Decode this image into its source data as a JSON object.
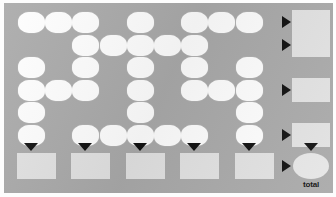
{
  "puzzle": {
    "title": "number crossword sum grid",
    "colors": {
      "board_background": "#aaaaaa",
      "cell_fill": "#fefefe",
      "sum_box_fill": "#e2e2e2",
      "arrow": "#111111",
      "page_background": "#ffffff"
    },
    "grid": {
      "columns": 9,
      "rows": 6,
      "cell_width": 27,
      "cell_height": 21,
      "origin_x": 14,
      "origin_y": 9,
      "col_step": 27.2,
      "row_step": 22.6
    },
    "cells": [
      {
        "row": 1,
        "col": 1,
        "value": ""
      },
      {
        "row": 1,
        "col": 2,
        "value": ""
      },
      {
        "row": 1,
        "col": 3,
        "value": ""
      },
      {
        "row": 1,
        "col": 5,
        "value": ""
      },
      {
        "row": 1,
        "col": 7,
        "value": ""
      },
      {
        "row": 1,
        "col": 8,
        "value": ""
      },
      {
        "row": 1,
        "col": 9,
        "value": ""
      },
      {
        "row": 2,
        "col": 3,
        "value": ""
      },
      {
        "row": 2,
        "col": 4,
        "value": ""
      },
      {
        "row": 2,
        "col": 5,
        "value": ""
      },
      {
        "row": 2,
        "col": 6,
        "value": ""
      },
      {
        "row": 2,
        "col": 7,
        "value": ""
      },
      {
        "row": 3,
        "col": 1,
        "value": ""
      },
      {
        "row": 3,
        "col": 3,
        "value": ""
      },
      {
        "row": 3,
        "col": 5,
        "value": ""
      },
      {
        "row": 3,
        "col": 7,
        "value": ""
      },
      {
        "row": 3,
        "col": 9,
        "value": ""
      },
      {
        "row": 4,
        "col": 1,
        "value": ""
      },
      {
        "row": 4,
        "col": 2,
        "value": ""
      },
      {
        "row": 4,
        "col": 3,
        "value": ""
      },
      {
        "row": 4,
        "col": 5,
        "value": ""
      },
      {
        "row": 4,
        "col": 7,
        "value": ""
      },
      {
        "row": 4,
        "col": 8,
        "value": ""
      },
      {
        "row": 4,
        "col": 9,
        "value": ""
      },
      {
        "row": 5,
        "col": 1,
        "value": ""
      },
      {
        "row": 5,
        "col": 5,
        "value": ""
      },
      {
        "row": 5,
        "col": 9,
        "value": ""
      },
      {
        "row": 6,
        "col": 1,
        "value": ""
      },
      {
        "row": 6,
        "col": 3,
        "value": ""
      },
      {
        "row": 6,
        "col": 4,
        "value": ""
      },
      {
        "row": 6,
        "col": 5,
        "value": ""
      },
      {
        "row": 6,
        "col": 6,
        "value": ""
      },
      {
        "row": 6,
        "col": 7,
        "value": ""
      },
      {
        "row": 6,
        "col": 9,
        "value": ""
      }
    ],
    "row_sums": [
      {
        "row": 1,
        "arrow": "arrow-right",
        "value": ""
      },
      {
        "row": 2,
        "arrow": "arrow-right",
        "value": ""
      },
      {
        "row": 4,
        "arrow": "arrow-right",
        "value": ""
      },
      {
        "row": 6,
        "arrow": "arrow-right",
        "value": ""
      }
    ],
    "column_sums": [
      {
        "col": 1,
        "arrow": "arrow-down",
        "value": ""
      },
      {
        "col": 3,
        "arrow": "arrow-down",
        "value": ""
      },
      {
        "col": 5,
        "arrow": "arrow-down",
        "value": ""
      },
      {
        "col": 7,
        "arrow": "arrow-down",
        "value": ""
      },
      {
        "col": 9,
        "arrow": "arrow-down",
        "value": ""
      }
    ],
    "total": {
      "label": "total",
      "value": "",
      "arrow_from_left": "arrow-right",
      "arrow_from_top": "arrow-down"
    }
  }
}
